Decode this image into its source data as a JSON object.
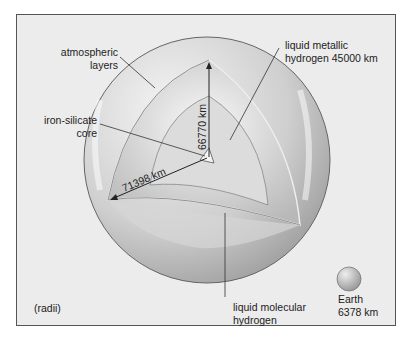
{
  "labels": {
    "atmospheric_1": "atmospheric",
    "atmospheric_2": "layers",
    "core_1": "iron-silicate",
    "core_2": "core",
    "metallic_1": "liquid metallic",
    "metallic_2": "hydrogen 45000 km",
    "molecular_1": "liquid molecular",
    "molecular_2": "hydrogen",
    "radii_note": "(radii)",
    "earth_1": "Earth",
    "earth_2": "6378 km"
  },
  "dimensions": {
    "polar_radius": "66770 km",
    "equatorial_radius": "71398 km"
  },
  "colors": {
    "background": "#ececec",
    "frame": "#555555",
    "line": "#333333"
  }
}
